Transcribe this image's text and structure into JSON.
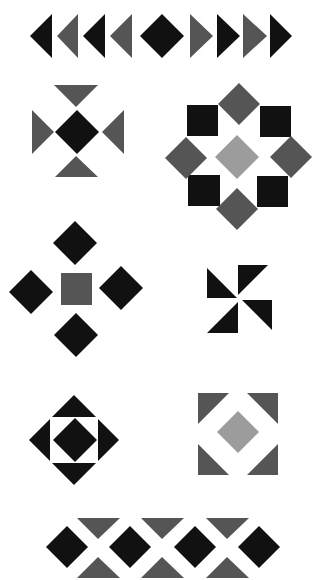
{
  "colors": {
    "background": "#ffffff",
    "black": "#111111",
    "gray": "#555555",
    "light_gray": "#9c9c9c"
  },
  "motifs": [
    {
      "name": "arrow-border",
      "shapes": [
        {
          "type": "tri",
          "color": "black",
          "points": [
            [
              30,
              36
            ],
            [
              52,
              14
            ],
            [
              52,
              58
            ]
          ]
        },
        {
          "type": "tri",
          "color": "gray",
          "points": [
            [
              57,
              36
            ],
            [
              78,
              14
            ],
            [
              78,
              58
            ]
          ]
        },
        {
          "type": "tri",
          "color": "black",
          "points": [
            [
              83,
              36
            ],
            [
              105,
              14
            ],
            [
              105,
              58
            ]
          ]
        },
        {
          "type": "tri",
          "color": "gray",
          "points": [
            [
              110,
              36
            ],
            [
              132,
              14
            ],
            [
              132,
              58
            ]
          ]
        },
        {
          "type": "diamond",
          "color": "black",
          "cx": 162,
          "cy": 36,
          "r": 22
        },
        {
          "type": "tri",
          "color": "gray",
          "points": [
            [
              190,
              14
            ],
            [
              190,
              58
            ],
            [
              213,
              36
            ]
          ]
        },
        {
          "type": "tri",
          "color": "black",
          "points": [
            [
              217,
              14
            ],
            [
              217,
              58
            ],
            [
              240,
              36
            ]
          ]
        },
        {
          "type": "tri",
          "color": "gray",
          "points": [
            [
              243,
              14
            ],
            [
              243,
              58
            ],
            [
              267,
              36
            ]
          ]
        },
        {
          "type": "tri",
          "color": "black",
          "points": [
            [
              270,
              14
            ],
            [
              270,
              58
            ],
            [
              292,
              36
            ]
          ]
        }
      ]
    },
    {
      "name": "triangle-cross",
      "shapes": [
        {
          "type": "tri",
          "color": "gray",
          "points": [
            [
              54,
              85
            ],
            [
              98,
              85
            ],
            [
              76,
              107
            ]
          ]
        },
        {
          "type": "tri",
          "color": "gray",
          "points": [
            [
              32,
              110
            ],
            [
              32,
              154
            ],
            [
              54,
              132
            ]
          ]
        },
        {
          "type": "diamond",
          "color": "black",
          "cx": 77,
          "cy": 132,
          "r": 22
        },
        {
          "type": "tri",
          "color": "gray",
          "points": [
            [
              124,
              110
            ],
            [
              124,
              154
            ],
            [
              102,
              132
            ]
          ]
        },
        {
          "type": "tri",
          "color": "gray",
          "points": [
            [
              76,
              156
            ],
            [
              55,
              177
            ],
            [
              98,
              177
            ]
          ]
        }
      ]
    },
    {
      "name": "octagon-star",
      "shapes": [
        {
          "type": "rect",
          "color": "black",
          "x": 187,
          "y": 105,
          "w": 31,
          "h": 31
        },
        {
          "type": "rect",
          "color": "black",
          "x": 260,
          "y": 106,
          "w": 31,
          "h": 31
        },
        {
          "type": "rect",
          "color": "black",
          "x": 188,
          "y": 175,
          "w": 32,
          "h": 31
        },
        {
          "type": "rect",
          "color": "black",
          "x": 257,
          "y": 176,
          "w": 31,
          "h": 31
        },
        {
          "type": "diamond",
          "color": "gray",
          "cx": 239,
          "cy": 104,
          "r": 21
        },
        {
          "type": "diamond",
          "color": "gray",
          "cx": 186,
          "cy": 158,
          "r": 21
        },
        {
          "type": "diamond",
          "color": "gray",
          "cx": 291,
          "cy": 157,
          "r": 21
        },
        {
          "type": "diamond",
          "color": "gray",
          "cx": 237,
          "cy": 209,
          "r": 21
        },
        {
          "type": "diamond",
          "color": "light_gray",
          "cx": 237,
          "cy": 157,
          "r": 22
        }
      ]
    },
    {
      "name": "diamond-cross",
      "shapes": [
        {
          "type": "diamond",
          "color": "black",
          "cx": 75,
          "cy": 243,
          "r": 22
        },
        {
          "type": "diamond",
          "color": "black",
          "cx": 31,
          "cy": 292,
          "r": 22
        },
        {
          "type": "rect",
          "color": "gray",
          "x": 61,
          "y": 273,
          "w": 31,
          "h": 32
        },
        {
          "type": "diamond",
          "color": "black",
          "cx": 121,
          "cy": 288,
          "r": 22
        },
        {
          "type": "diamond",
          "color": "black",
          "cx": 76,
          "cy": 335,
          "r": 22
        }
      ]
    },
    {
      "name": "pinwheel",
      "shapes": [
        {
          "type": "tri",
          "color": "black",
          "points": [
            [
              207,
              268
            ],
            [
              207,
              298
            ],
            [
              237,
              298
            ]
          ]
        },
        {
          "type": "tri",
          "color": "black",
          "points": [
            [
              238,
              265
            ],
            [
              268,
              265
            ],
            [
              238,
              295
            ]
          ]
        },
        {
          "type": "tri",
          "color": "black",
          "points": [
            [
              242,
              300
            ],
            [
              272,
              300
            ],
            [
              272,
              330
            ]
          ]
        },
        {
          "type": "tri",
          "color": "black",
          "points": [
            [
              238,
              302
            ],
            [
              238,
              333
            ],
            [
              207,
              333
            ]
          ]
        }
      ]
    },
    {
      "name": "square-in-diamond",
      "shapes": [
        {
          "type": "diamond",
          "color": "black",
          "cx": 74,
          "cy": 440,
          "r": 45
        },
        {
          "type": "rect",
          "color": "background",
          "x": 50,
          "y": 417,
          "w": 48,
          "h": 46
        },
        {
          "type": "diamond",
          "color": "black",
          "cx": 75,
          "cy": 440,
          "r": 22
        }
      ]
    },
    {
      "name": "corner-square",
      "shapes": [
        {
          "type": "tri",
          "color": "gray",
          "points": [
            [
              198,
              393
            ],
            [
              229,
              393
            ],
            [
              198,
              424
            ]
          ]
        },
        {
          "type": "tri",
          "color": "gray",
          "points": [
            [
              247,
              393
            ],
            [
              278,
              393
            ],
            [
              278,
              424
            ]
          ]
        },
        {
          "type": "tri",
          "color": "gray",
          "points": [
            [
              198,
              444
            ],
            [
              198,
              475
            ],
            [
              229,
              475
            ]
          ]
        },
        {
          "type": "tri",
          "color": "gray",
          "points": [
            [
              278,
              444
            ],
            [
              278,
              475
            ],
            [
              247,
              475
            ]
          ]
        },
        {
          "type": "diamond",
          "color": "light_gray",
          "cx": 238,
          "cy": 432,
          "r": 21
        }
      ]
    },
    {
      "name": "diamond-triangle-border",
      "shapes": [
        {
          "type": "diamond",
          "color": "black",
          "cx": 67,
          "cy": 547,
          "r": 21
        },
        {
          "type": "tri",
          "color": "gray",
          "points": [
            [
              77,
              518
            ],
            [
              120,
              518
            ],
            [
              98,
              539
            ]
          ]
        },
        {
          "type": "tri",
          "color": "gray",
          "points": [
            [
              98,
              557
            ],
            [
              77,
              578
            ],
            [
              120,
              578
            ]
          ]
        },
        {
          "type": "diamond",
          "color": "black",
          "cx": 130,
          "cy": 547,
          "r": 21
        },
        {
          "type": "tri",
          "color": "gray",
          "points": [
            [
              141,
              518
            ],
            [
              184,
              518
            ],
            [
              162,
              539
            ]
          ]
        },
        {
          "type": "tri",
          "color": "gray",
          "points": [
            [
              162,
              557
            ],
            [
              141,
              578
            ],
            [
              184,
              578
            ]
          ]
        },
        {
          "type": "diamond",
          "color": "black",
          "cx": 195,
          "cy": 547,
          "r": 21
        },
        {
          "type": "tri",
          "color": "gray",
          "points": [
            [
              206,
              518
            ],
            [
              249,
              518
            ],
            [
              227,
              539
            ]
          ]
        },
        {
          "type": "tri",
          "color": "gray",
          "points": [
            [
              227,
              557
            ],
            [
              206,
              578
            ],
            [
              249,
              578
            ]
          ]
        },
        {
          "type": "diamond",
          "color": "black",
          "cx": 259,
          "cy": 547,
          "r": 21
        }
      ]
    }
  ]
}
